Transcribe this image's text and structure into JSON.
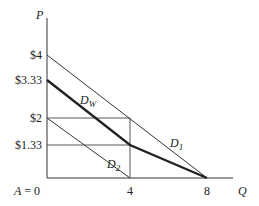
{
  "diagram": {
    "axes": {
      "y_label": "P",
      "x_label": "Q",
      "origin_label": "A = 0"
    },
    "y_ticks": [
      {
        "label": "$4",
        "value": 4
      },
      {
        "label": "$3.33",
        "value": 3.33
      },
      {
        "label": "$2",
        "value": 2
      },
      {
        "label": "$1.33",
        "value": 1.33
      }
    ],
    "x_ticks": [
      {
        "label": "4",
        "value": 4
      },
      {
        "label": "8",
        "value": 8
      }
    ],
    "curves": {
      "d1": {
        "label_main": "D",
        "label_sub": "1",
        "from": [
          0,
          4
        ],
        "to": [
          8,
          0
        ]
      },
      "d2": {
        "label_main": "D",
        "label_sub": "2",
        "from": [
          0,
          2
        ],
        "to": [
          4,
          0
        ]
      },
      "dw": {
        "label_main": "D",
        "label_sub": "W",
        "points": [
          [
            0,
            3.33
          ],
          [
            4,
            1.33
          ],
          [
            8,
            0
          ]
        ]
      }
    },
    "guides": {
      "horizontal_at_2": {
        "from": [
          0,
          2
        ],
        "to": [
          4,
          2
        ]
      },
      "horizontal_at_1_33": {
        "from": [
          0,
          1.33
        ],
        "to": [
          4,
          1.33
        ]
      },
      "vertical_at_4": {
        "from": [
          4,
          2
        ],
        "to": [
          4,
          0
        ]
      }
    },
    "colors": {
      "line": "#333333",
      "text": "#222222",
      "background": "#ffffff"
    }
  }
}
